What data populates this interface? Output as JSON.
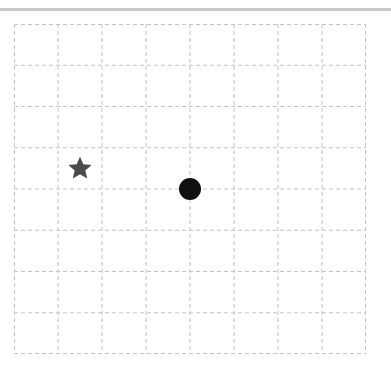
{
  "board": {
    "columns": 8,
    "rows": 8,
    "grid_color": "#c4c4c4",
    "background": "#ffffff"
  },
  "pieces": [
    {
      "type": "star",
      "icon": "star-icon",
      "col": 1,
      "row": 3,
      "color": "#4a4a4a"
    },
    {
      "type": "circle",
      "icon": "circle-icon",
      "intersection_col": 4,
      "intersection_row": 4,
      "color": "#111111"
    }
  ],
  "top_bar": {
    "color": "#c8c8c8"
  }
}
